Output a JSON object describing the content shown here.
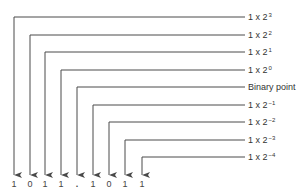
{
  "digits": [
    "1",
    "0",
    "1",
    "1",
    ".",
    "1",
    "0",
    "1",
    "1"
  ],
  "labels": [
    {
      "base": "1 x 2",
      "exp": "3"
    },
    {
      "base": "1 x 2",
      "exp": "2"
    },
    {
      "base": "1 x 2",
      "exp": "1"
    },
    {
      "base": "1 x 2",
      "exp": "0"
    },
    {
      "base": "Binary point",
      "exp": ""
    },
    {
      "base": "1 x 2",
      "exp": "−1"
    },
    {
      "base": "1 x 2",
      "exp": "−2"
    },
    {
      "base": "1 x 2",
      "exp": "−3"
    },
    {
      "base": "1 x 2",
      "exp": "−4"
    }
  ],
  "colors": {
    "line": "#4a4a4a",
    "text": "#333333"
  }
}
